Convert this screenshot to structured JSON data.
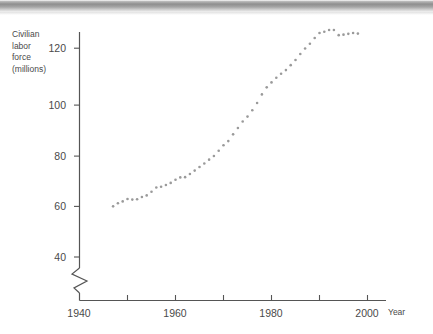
{
  "figure": {
    "scan_bar": {
      "name": "page-edge-artifact",
      "color": "#8e8e8e"
    }
  },
  "chart_data": {
    "type": "scatter",
    "title": "",
    "subtitle": "",
    "xlabel": "Year",
    "ylabel": "Civilian\nlabor\nforce\n(millions)",
    "ylabel_lines": [
      "Civilian",
      "labor",
      "force",
      "(millions)"
    ],
    "xlim": [
      1940,
      2002
    ],
    "ylim": [
      33,
      132
    ],
    "axis_break": true,
    "axis_break_note": "zigzag break on y-axis below 40",
    "grid": false,
    "legend": false,
    "marker_color": "#9a9a9a",
    "marker_size_px": 2.6,
    "axis_color": "#555555",
    "xticks": [
      1940,
      1960,
      1980,
      2000
    ],
    "xtick_labels": [
      "1940",
      "1960",
      "1980",
      "2000"
    ],
    "xminor_ticks": [
      1950,
      1970,
      1990
    ],
    "yticks": [
      40,
      60,
      80,
      100,
      120
    ],
    "ytick_labels": [
      "40",
      "60",
      "80",
      "100",
      "120"
    ],
    "x": [
      1947,
      1948,
      1949,
      1950,
      1951,
      1952,
      1953,
      1954,
      1955,
      1956,
      1957,
      1958,
      1959,
      1960,
      1961,
      1962,
      1963,
      1964,
      1965,
      1966,
      1967,
      1968,
      1969,
      1970,
      1971,
      1972,
      1973,
      1974,
      1975,
      1976,
      1977,
      1978,
      1979,
      1980,
      1981,
      1982,
      1983,
      1984,
      1985,
      1986,
      1987,
      1988,
      1989,
      1990,
      1991,
      1992,
      1993,
      1994,
      1995,
      1996,
      1997,
      1998
    ],
    "y": [
      59.4,
      60.6,
      61.3,
      62.2,
      62.0,
      62.1,
      63.0,
      63.6,
      65.0,
      66.6,
      66.9,
      67.6,
      68.4,
      69.6,
      70.5,
      70.6,
      71.8,
      73.1,
      74.5,
      75.8,
      77.3,
      78.7,
      80.7,
      82.8,
      84.4,
      87.0,
      89.4,
      91.9,
      93.8,
      96.2,
      99.0,
      102.3,
      105.0,
      106.9,
      108.7,
      110.2,
      111.6,
      113.5,
      115.5,
      117.8,
      119.9,
      121.7,
      123.9,
      125.8,
      126.3,
      127.0,
      127.0,
      125.0,
      125.2,
      125.5,
      125.8,
      125.6
    ],
    "series_name": "Civilian labor force",
    "units": "millions",
    "n_points": 52
  }
}
